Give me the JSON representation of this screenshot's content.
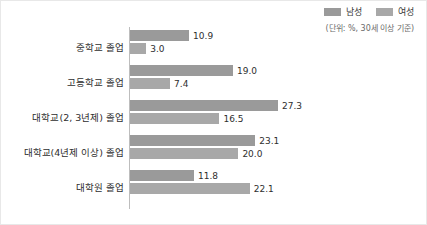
{
  "legend": {
    "items": [
      {
        "label": "남성",
        "color": "#9a9a9a",
        "swatch_name": "legend-swatch-male"
      },
      {
        "label": "여성",
        "color": "#a8a8a8",
        "swatch_name": "legend-swatch-female"
      }
    ],
    "unit_note": "(단위: %, 30세 이상 기준)"
  },
  "chart_data": {
    "type": "bar",
    "orientation": "horizontal",
    "title": "",
    "subtitle": "(단위: %, 30세 이상 기준)",
    "xlabel": "",
    "ylabel": "",
    "xlim": [
      0,
      30
    ],
    "grid": false,
    "legend_position": "top-right",
    "categories": [
      "중학교 졸업",
      "고등학교 졸업",
      "대학교(2, 3년제) 졸업",
      "대학교(4년제 이상) 졸업",
      "대학원 졸업"
    ],
    "series": [
      {
        "name": "남성",
        "color": "#9a9a9a",
        "values": [
          10.9,
          19.0,
          27.3,
          23.1,
          11.8
        ],
        "labels": [
          "10.9",
          "19.0",
          "27.3",
          "23.1",
          "11.8"
        ]
      },
      {
        "name": "여성",
        "color": "#a8a8a8",
        "values": [
          3.0,
          7.4,
          16.5,
          20.0,
          22.1
        ],
        "labels": [
          "3.0",
          "7.4",
          "16.5",
          "20.0",
          "22.1"
        ]
      }
    ],
    "px_per_unit": 5.42
  }
}
